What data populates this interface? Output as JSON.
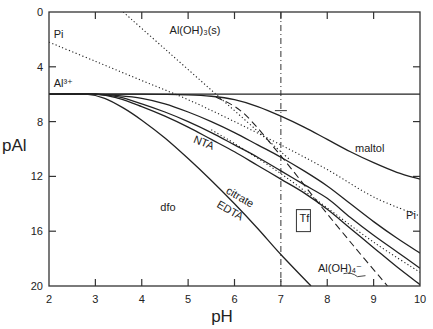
{
  "chart_data": {
    "type": "line",
    "title": "",
    "xlabel": "pH",
    "ylabel": "pAl",
    "xlim": [
      2,
      10
    ],
    "ylim": [
      0,
      20
    ],
    "y_inverted": true,
    "x_ticks": [
      "2",
      "3",
      "4",
      "5",
      "6",
      "7",
      "8",
      "9",
      "10"
    ],
    "y_ticks": [
      "0",
      "4",
      "8",
      "12",
      "16",
      "20"
    ],
    "grid": false,
    "reference_line": {
      "x": 7,
      "style": "dash-dot vertical"
    },
    "series": [
      {
        "name": "Al3+",
        "style": "solid",
        "x": [
          2,
          10
        ],
        "y": [
          6,
          6
        ],
        "label": "Al³⁺"
      },
      {
        "name": "maltol",
        "style": "solid",
        "x": [
          2,
          4,
          5,
          5.5,
          6,
          6.5,
          7,
          7.5,
          8,
          8.5,
          9,
          9.5,
          10
        ],
        "y": [
          6,
          6,
          6.05,
          6.15,
          6.4,
          6.9,
          7.6,
          8.4,
          9.3,
          10.2,
          11.0,
          11.7,
          12.2
        ]
      },
      {
        "name": "NTA",
        "style": "solid",
        "x": [
          2,
          3,
          3.5,
          4,
          4.5,
          5,
          5.5,
          6,
          6.5,
          7,
          7.5,
          8,
          8.5,
          9,
          9.5,
          10
        ],
        "y": [
          6,
          6,
          6.1,
          6.3,
          6.7,
          7.3,
          8.0,
          8.8,
          9.7,
          10.6,
          11.6,
          12.7,
          14.0,
          15.3,
          16.5,
          17.6
        ]
      },
      {
        "name": "citrate",
        "style": "solid",
        "x": [
          2,
          3,
          3.5,
          4,
          4.5,
          5,
          5.5,
          6,
          6.5,
          7,
          7.5,
          8,
          8.5,
          9,
          9.5,
          10
        ],
        "y": [
          6,
          6,
          6.2,
          6.7,
          7.3,
          8.0,
          8.8,
          9.7,
          10.6,
          11.6,
          12.6,
          13.6,
          15.0,
          16.3,
          17.5,
          18.7
        ]
      },
      {
        "name": "EDTA",
        "style": "solid",
        "x": [
          2,
          3,
          3.5,
          4,
          4.5,
          5,
          5.5,
          6,
          6.5,
          7,
          7.5,
          8,
          8.5,
          9,
          9.5,
          10
        ],
        "y": [
          6,
          6,
          6.3,
          6.9,
          7.6,
          8.4,
          9.3,
          10.2,
          11.2,
          12.2,
          13.2,
          14.4,
          15.8,
          17.2,
          18.6,
          19.9
        ]
      },
      {
        "name": "dfo",
        "style": "solid",
        "x": [
          2,
          2.8,
          3.2,
          3.6,
          4,
          4.5,
          5,
          5.5,
          6,
          6.5,
          7,
          7.65
        ],
        "y": [
          6,
          6,
          6.3,
          7.0,
          7.9,
          9.2,
          10.7,
          12.3,
          14.0,
          15.8,
          17.7,
          20
        ]
      },
      {
        "name": "Pi",
        "style": "dotted",
        "x": [
          2,
          3,
          4,
          5,
          6,
          7,
          8,
          9,
          10
        ],
        "y": [
          2.2,
          3.6,
          5.0,
          6.4,
          8.0,
          9.7,
          11.5,
          13.5,
          14.9
        ],
        "label": "Pi"
      },
      {
        "name": "Al(OH)3(s)",
        "style": "dotted",
        "x": [
          3.6,
          4.5,
          5.5,
          6.5,
          7.2
        ],
        "y": [
          0,
          2.7,
          5.7,
          8.7,
          10.8
        ],
        "label": "Al(OH)₃(s)"
      },
      {
        "name": "Pi (lower)",
        "style": "dotted",
        "x": [
          5.5,
          6,
          7,
          8,
          9,
          10
        ],
        "y": [
          8.6,
          9.6,
          11.8,
          14.3,
          16.8,
          19.0
        ]
      },
      {
        "name": "Al(OH)4-",
        "style": "dashed",
        "x": [
          5.6,
          6.2,
          7,
          7.8,
          8.6,
          9.3
        ],
        "y": [
          6.2,
          7.4,
          10.5,
          13.9,
          17.2,
          20
        ],
        "label": "Al(OH)₄⁻"
      }
    ],
    "annotations": [
      {
        "text": "Pi",
        "x": 2.1,
        "y": 1.9
      },
      {
        "text": "Al³⁺",
        "x": 2.1,
        "y": 5.5
      },
      {
        "text": "Al(OH)₃(s)",
        "x": 4.6,
        "y": 1.6
      },
      {
        "text": "NTA",
        "x": 5.1,
        "y": 9.5
      },
      {
        "text": "maltol",
        "x": 8.6,
        "y": 10.2
      },
      {
        "text": "citrate",
        "x": 5.8,
        "y": 13.2
      },
      {
        "text": "EDTA",
        "x": 5.6,
        "y": 14.2
      },
      {
        "text": "dfo",
        "x": 4.4,
        "y": 14.5
      },
      {
        "text": "Tf",
        "x": 7.4,
        "y": 15.3,
        "boxed": true
      },
      {
        "text": "Pi",
        "x": 9.7,
        "y": 15.1
      },
      {
        "text": "Al(OH)₄⁻",
        "x": 7.8,
        "y": 19.0
      }
    ]
  }
}
